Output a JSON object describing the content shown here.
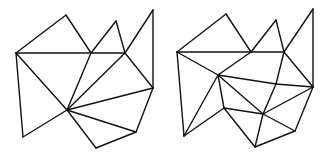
{
  "diagram": {
    "stroke_color": "#111111",
    "background": "#ffffff",
    "figures": [
      {
        "name": "triangulation-left",
        "vertices": {
          "A": [
            16,
            53
          ],
          "B": [
            66,
            15
          ],
          "C": [
            91,
            53
          ],
          "D": [
            116,
            21
          ],
          "E": [
            125,
            53
          ],
          "F": [
            153,
            10
          ],
          "G": [
            153,
            88
          ],
          "H": [
            67,
            110
          ],
          "I": [
            136,
            132
          ],
          "J": [
            96,
            148
          ],
          "K": [
            23,
            137
          ]
        },
        "edges": [
          [
            "A",
            "B"
          ],
          [
            "B",
            "C"
          ],
          [
            "A",
            "C"
          ],
          [
            "C",
            "E"
          ],
          [
            "C",
            "D"
          ],
          [
            "D",
            "E"
          ],
          [
            "E",
            "F"
          ],
          [
            "F",
            "G"
          ],
          [
            "A",
            "K"
          ],
          [
            "A",
            "H"
          ],
          [
            "K",
            "H"
          ],
          [
            "C",
            "H"
          ],
          [
            "E",
            "H"
          ],
          [
            "E",
            "G"
          ],
          [
            "G",
            "H"
          ],
          [
            "G",
            "I"
          ],
          [
            "H",
            "I"
          ],
          [
            "H",
            "J"
          ],
          [
            "I",
            "J"
          ]
        ]
      },
      {
        "name": "triangulation-right",
        "vertices": {
          "A": [
            177,
            52
          ],
          "B": [
            226,
            14
          ],
          "C": [
            251,
            52
          ],
          "D": [
            276,
            20
          ],
          "E": [
            284,
            52
          ],
          "F": [
            313,
            9
          ],
          "G": [
            313,
            87
          ],
          "P": [
            218,
            75
          ],
          "Q": [
            276,
            84
          ],
          "R": [
            224,
            108
          ],
          "S": [
            263,
            114
          ],
          "I": [
            295,
            131
          ],
          "J": [
            255,
            147
          ],
          "K": [
            184,
            136
          ]
        },
        "edges": [
          [
            "A",
            "B"
          ],
          [
            "B",
            "C"
          ],
          [
            "A",
            "C"
          ],
          [
            "C",
            "E"
          ],
          [
            "C",
            "D"
          ],
          [
            "D",
            "E"
          ],
          [
            "E",
            "F"
          ],
          [
            "F",
            "G"
          ],
          [
            "A",
            "K"
          ],
          [
            "A",
            "P"
          ],
          [
            "P",
            "C"
          ],
          [
            "P",
            "K"
          ],
          [
            "P",
            "R"
          ],
          [
            "P",
            "Q"
          ],
          [
            "P",
            "S"
          ],
          [
            "E",
            "Q"
          ],
          [
            "E",
            "G"
          ],
          [
            "Q",
            "G"
          ],
          [
            "Q",
            "S"
          ],
          [
            "R",
            "K"
          ],
          [
            "R",
            "S"
          ],
          [
            "R",
            "J"
          ],
          [
            "S",
            "J"
          ],
          [
            "S",
            "I"
          ],
          [
            "S",
            "G"
          ],
          [
            "G",
            "I"
          ],
          [
            "I",
            "J"
          ]
        ]
      }
    ]
  }
}
